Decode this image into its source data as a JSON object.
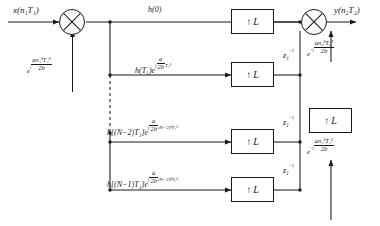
{
  "diagram": {
    "input_label": "x(n₁T₁)",
    "output_label": "y(n₂T₂)",
    "stroke_color": "#1a1a1a",
    "background": "#ffffff"
  },
  "input_chirp": {
    "base": "e",
    "exp_sign": "j",
    "num": "an₁²T₁²",
    "den": "2b",
    "full": "e^{j an₁²T₁²/2b}"
  },
  "output_chirps": [
    {
      "id": "chirp-out-upper",
      "base": "e",
      "exp_sign": "−j",
      "num": "an₂²T₂²",
      "den": "2b",
      "full": "e^{-j an₂²T₂²/2b}"
    },
    {
      "id": "chirp-out-lower",
      "base": "e",
      "exp_sign": "−j",
      "num": "an₁²T₁²",
      "den": "2b",
      "full": "e^{-j an₁²T₁²/2b}"
    }
  ],
  "taps": [
    {
      "id": "tap-0",
      "coef": "h(0)",
      "has_exp": false,
      "exp_sign": "",
      "num": "",
      "den": "",
      "exp_tail": "",
      "full": "h(0)"
    },
    {
      "id": "tap-1",
      "coef": "h(T₁)",
      "has_exp": true,
      "exp_sign": "j",
      "num": "a",
      "den": "2b",
      "exp_tail": "T₁²",
      "full": "h(T₁)e^{j (a/2b) T₁²}"
    },
    {
      "id": "tap-n-2",
      "coef": "h[(N−2)T₁]",
      "has_exp": true,
      "exp_sign": "j",
      "num": "a",
      "den": "2b",
      "exp_tail": "(N−2)²T₁²",
      "full": "h[(N−2)T₁]e^{j (a/2b)(N−2)²T₁²}"
    },
    {
      "id": "tap-n-1",
      "coef": "h[(N−1)T₁]",
      "has_exp": true,
      "exp_sign": "j",
      "num": "a",
      "den": "2b",
      "exp_tail": "(N−2)²T₁²",
      "full": "h[(N−1)T₁]e^{j (a/2b)(N−2)²T₁²}"
    }
  ],
  "upsamplers": [
    {
      "id": "upsampler-row-0",
      "arrow": "↑",
      "factor": "L"
    },
    {
      "id": "upsampler-row-1",
      "arrow": "↑",
      "factor": "L"
    },
    {
      "id": "upsampler-row-2",
      "arrow": "↑",
      "factor": "L"
    },
    {
      "id": "upsampler-row-3",
      "arrow": "↑",
      "factor": "L"
    },
    {
      "id": "upsampler-output",
      "arrow": "↑",
      "factor": "L"
    }
  ],
  "delays": [
    {
      "id": "delay-1",
      "label": "z₁",
      "exp": "−1"
    },
    {
      "id": "delay-2",
      "label": "z₁",
      "exp": "−1"
    },
    {
      "id": "delay-3",
      "label": "z₁",
      "exp": "−1"
    }
  ],
  "multipliers": [
    {
      "id": "multiplier-input",
      "symbol": "⊗"
    },
    {
      "id": "multiplier-output",
      "symbol": "⊗"
    }
  ],
  "continuation": {
    "style": "dashed-vertical",
    "meaning": "rows omitted"
  }
}
